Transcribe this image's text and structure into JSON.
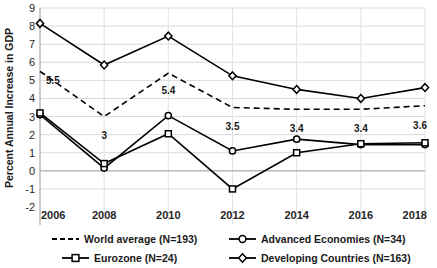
{
  "chart_data": {
    "type": "line",
    "title": "",
    "xlabel": "",
    "ylabel": "Percent Annual Increase in GDP",
    "x": [
      2006,
      2008,
      2010,
      2012,
      2014,
      2016,
      2018
    ],
    "categories": [
      "2006",
      "2008",
      "2010",
      "2012",
      "2014",
      "2016",
      "2018"
    ],
    "xlim": [
      2006,
      2018
    ],
    "ylim": [
      -2,
      9
    ],
    "yticks": [
      -2,
      -1,
      0,
      1,
      2,
      3,
      4,
      5,
      6,
      7,
      8,
      9
    ],
    "ytick_labels": [
      "-2",
      "-1",
      "0",
      "1",
      "2",
      "3",
      "4",
      "5",
      "6",
      "7",
      "8",
      "9"
    ],
    "grid": "horizontal-and-vertical",
    "legend_position": "bottom",
    "series": [
      {
        "name": "World average (N=193)",
        "key": "world",
        "style": "dashed",
        "marker": "none",
        "color": "#000000",
        "values": [
          5.5,
          3.0,
          5.4,
          3.5,
          3.4,
          3.4,
          3.6
        ],
        "data_labels": [
          "5.5",
          "3",
          "5.4",
          "3.5",
          "3.4",
          "3.4",
          "3.6"
        ]
      },
      {
        "name": "Advanced Economies (N=34)",
        "key": "advanced",
        "style": "solid",
        "marker": "circle",
        "color": "#000000",
        "values": [
          3.1,
          0.15,
          3.05,
          1.1,
          1.75,
          1.45,
          1.45
        ],
        "data_labels": []
      },
      {
        "name": "Eurozone (N=24)",
        "key": "eurozone",
        "style": "solid",
        "marker": "square",
        "color": "#000000",
        "values": [
          3.2,
          0.4,
          2.05,
          -1.0,
          1.0,
          1.5,
          1.55
        ],
        "data_labels": []
      },
      {
        "name": "Developing Countries (N=163)",
        "key": "developing",
        "style": "solid",
        "marker": "diamond",
        "color": "#000000",
        "values": [
          8.15,
          5.85,
          7.45,
          5.25,
          4.5,
          4.0,
          4.6
        ],
        "data_labels": []
      }
    ],
    "annotations": [
      {
        "text": "5.5",
        "x": 2006,
        "y": 5.5
      },
      {
        "text": "3",
        "x": 2008,
        "y": 3.0
      },
      {
        "text": "5.4",
        "x": 2010,
        "y": 5.4
      },
      {
        "text": "3.5",
        "x": 2012,
        "y": 3.5
      },
      {
        "text": "3.4",
        "x": 2014,
        "y": 3.4
      },
      {
        "text": "3.4",
        "x": 2016,
        "y": 3.4
      },
      {
        "text": "3.6",
        "x": 2018,
        "y": 3.6
      }
    ]
  },
  "legend": {
    "items": [
      {
        "label": "World average (N=193)",
        "marker": "dashed-line-icon"
      },
      {
        "label": "Advanced Economies (N=34)",
        "marker": "circle-marker-icon"
      },
      {
        "label": "Eurozone (N=24)",
        "marker": "square-marker-icon"
      },
      {
        "label": "Developing Countries (N=163)",
        "marker": "diamond-marker-icon"
      }
    ]
  }
}
